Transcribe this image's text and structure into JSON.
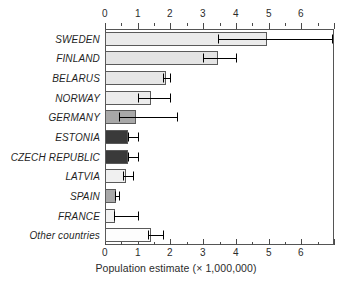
{
  "chart_data": {
    "type": "bar",
    "orientation": "horizontal",
    "title": "",
    "subtitle": "",
    "xlabel": "Population estimate (× 1,000,000)",
    "ylabel": "",
    "xlim": [
      0,
      7
    ],
    "ylim": null,
    "grid": false,
    "legend": null,
    "xticks": [
      0,
      1,
      2,
      3,
      4,
      5,
      6
    ],
    "xticklabels": [
      "0",
      "1",
      "2",
      "3",
      "4",
      "5",
      "6"
    ],
    "x_minor_tick_step": 0.5,
    "axis_positions": [
      "top",
      "bottom"
    ],
    "categories": [
      "SWEDEN",
      "FINLAND",
      "BELARUS",
      "NORWAY",
      "GERMANY",
      "ESTONIA",
      "CZECH REPUBLIC",
      "LATVIA",
      "SPAIN",
      "FRANCE",
      "Other countries"
    ],
    "values": [
      4.95,
      3.45,
      1.85,
      1.4,
      0.95,
      0.7,
      0.7,
      0.65,
      0.33,
      0.3,
      1.4
    ],
    "error_low": [
      3.45,
      3.0,
      1.78,
      1.02,
      0.42,
      0.7,
      0.7,
      0.55,
      0.3,
      0.28,
      1.32
    ],
    "error_high": [
      6.95,
      4.0,
      2.0,
      2.0,
      2.2,
      1.0,
      1.0,
      0.85,
      0.42,
      1.0,
      1.78
    ],
    "bar_colors": [
      "#ebebeb",
      "#e4e4e4",
      "#e6e6e6",
      "#ececec",
      "#a8a8a8",
      "#3a3a3a",
      "#3a3a3a",
      "#f0f0f0",
      "#a8a8a8",
      "#f2f2f2",
      "#fdfdfd"
    ],
    "bar_edge_color": "#5a5a5a",
    "error_bar_color": "#000000",
    "axis_color": "#555555",
    "background": "#ffffff"
  }
}
